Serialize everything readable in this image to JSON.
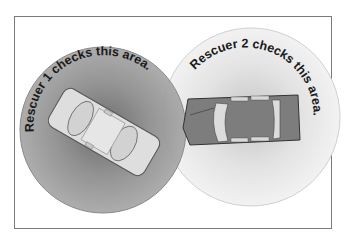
{
  "diagram": {
    "zones": [
      {
        "label": "Rescuer 1 checks this area.",
        "fill": "#9a9a9a",
        "vehicle": "light-car"
      },
      {
        "label": "Rescuer 2 checks this area.",
        "fill": "#ececec",
        "vehicle": "dark-car"
      }
    ],
    "colors": {
      "frame": "#7a7a7a",
      "zone1": "#9a9a9a",
      "zone2": "#ececec",
      "car1": "#dcdcdc",
      "car2": "#7d7d7d",
      "text": "#1a1a1a"
    }
  }
}
